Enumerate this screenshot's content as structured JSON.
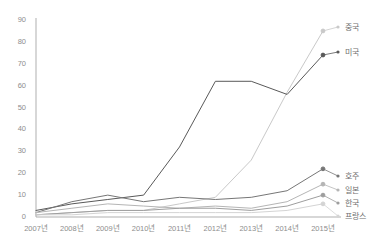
{
  "chart_data": {
    "type": "line",
    "title": "",
    "xlabel": "",
    "ylabel": "",
    "ylim": [
      0,
      90
    ],
    "yticks": [
      0,
      10,
      20,
      30,
      40,
      50,
      60,
      70,
      80,
      90
    ],
    "grid": false,
    "legend_position": "right-inline",
    "categories": [
      "2007년",
      "2008년",
      "2009년",
      "2010년",
      "2011년",
      "2012년",
      "2013년",
      "2014년",
      "2015년"
    ],
    "series": [
      {
        "name": "중국",
        "color": "#c9c9c9",
        "values": [
          1,
          2,
          3,
          3,
          6,
          9,
          26,
          57,
          85
        ]
      },
      {
        "name": "미국",
        "color": "#595959",
        "values": [
          3,
          6,
          8,
          10,
          32,
          62,
          62,
          56,
          74
        ]
      },
      {
        "name": "호주",
        "color": "#767676",
        "values": [
          2,
          7,
          10,
          7,
          9,
          8,
          9,
          12,
          22
        ]
      },
      {
        "name": "일본",
        "color": "#b5b5b5",
        "values": [
          2,
          4,
          6,
          5,
          4,
          5,
          4,
          7,
          15
        ]
      },
      {
        "name": "한국",
        "color": "#9e9e9e",
        "values": [
          1,
          2,
          3,
          3,
          4,
          4,
          3,
          5,
          10
        ]
      },
      {
        "name": "프랑스",
        "color": "#d4d4d4",
        "values": [
          1,
          1,
          2,
          2,
          2,
          2,
          2,
          3,
          6
        ]
      }
    ]
  },
  "axis": {
    "line_color": "#a6a6a6"
  }
}
